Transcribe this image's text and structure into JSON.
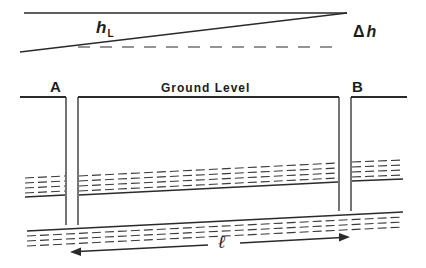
{
  "diagram": {
    "labels": {
      "head_loss": "h",
      "head_loss_subscript": "L",
      "delta_symbol": "Δ",
      "delta_h_var": "h",
      "well_a": "A",
      "well_b": "B",
      "ground_level": "Ground Level",
      "distance": "ℓ"
    },
    "elements": {
      "reference_line": "horizontal head reference at well B",
      "piezometric_line": "sloping potentiometric surface from A to B",
      "datum_dashed_line": "dashed horizontal at head level of well A",
      "wells": [
        "A",
        "B"
      ],
      "layers": [
        "upper aquifer (dashed hatching)",
        "lower aquifer (dashed hatching)"
      ],
      "arrow": "double-headed distance arrow between wells"
    },
    "colors": {
      "ink": "#2a2a2a",
      "background": "#ffffff"
    }
  }
}
